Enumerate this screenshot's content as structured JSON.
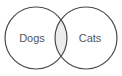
{
  "diagram": {
    "type": "venn",
    "title": "",
    "background_color": "#ffffff",
    "stroke_color": "#4a4a4a",
    "stroke_width": 1.2,
    "label_color": "#555555",
    "intersection_fill": "#ececec",
    "circle_fill": "#ffffff",
    "sets": [
      {
        "id": "left",
        "label": "Dogs",
        "center_x": 36,
        "center_y": 38,
        "radius": 31,
        "label_x": 32,
        "label_y": 42
      },
      {
        "id": "right",
        "label": "Cats",
        "center_x": 86,
        "center_y": 38,
        "radius": 31,
        "label_x": 90,
        "label_y": 42
      }
    ],
    "intersection": {
      "label": "",
      "top_point_x": 61,
      "top_point_y": 14,
      "bottom_point_x": 61,
      "bottom_point_y": 63
    }
  }
}
